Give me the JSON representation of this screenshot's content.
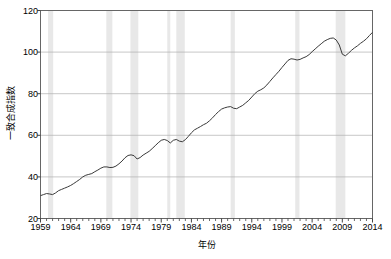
{
  "chart_data": {
    "type": "line",
    "title": "",
    "xlabel": "年份",
    "ylabel": "一致合成指数",
    "xlim": [
      1959,
      2014
    ],
    "ylim": [
      20,
      120
    ],
    "yticks": [
      20,
      40,
      60,
      80,
      100,
      120
    ],
    "ytick_labels": [
      "20",
      "40",
      "60",
      "80",
      "100",
      "120"
    ],
    "xticks": [
      1959,
      1964,
      1969,
      1974,
      1979,
      1984,
      1989,
      1994,
      1999,
      2004,
      2009,
      2014
    ],
    "xtick_labels": [
      "1959",
      "1964",
      "1969",
      "1974",
      "1979",
      "1984",
      "1989",
      "1994",
      "1999",
      "2004",
      "2009",
      "2014"
    ],
    "minor_xtick_interval": 1,
    "grid": "horizontal",
    "grid_color": "#b0b0b0",
    "legend": "none",
    "line_color": "#3a3a3a",
    "line_width": 1.0,
    "shaded_band_color": "#e8e8e8",
    "shaded_band_label": "recession",
    "recession_bands": [
      {
        "start": 1960.25,
        "end": 1961.1
      },
      {
        "start": 1969.9,
        "end": 1970.9
      },
      {
        "start": 1973.9,
        "end": 1975.2
      },
      {
        "start": 1980.0,
        "end": 1980.5
      },
      {
        "start": 1981.5,
        "end": 1982.9
      },
      {
        "start": 1990.5,
        "end": 1991.2
      },
      {
        "start": 2001.2,
        "end": 2001.9
      },
      {
        "start": 2007.9,
        "end": 2009.5
      }
    ],
    "series": [
      {
        "name": "一致合成指数",
        "x": [
          1959.0,
          1959.5,
          1960.0,
          1960.5,
          1961.0,
          1961.5,
          1962.0,
          1962.5,
          1963.0,
          1963.5,
          1964.0,
          1964.5,
          1965.0,
          1965.5,
          1966.0,
          1966.5,
          1967.0,
          1967.5,
          1968.0,
          1968.5,
          1969.0,
          1969.5,
          1970.0,
          1970.5,
          1971.0,
          1971.5,
          1972.0,
          1972.5,
          1973.0,
          1973.5,
          1974.0,
          1974.5,
          1975.0,
          1975.5,
          1976.0,
          1976.5,
          1977.0,
          1977.5,
          1978.0,
          1978.5,
          1979.0,
          1979.5,
          1980.0,
          1980.5,
          1981.0,
          1981.5,
          1982.0,
          1982.5,
          1983.0,
          1983.5,
          1984.0,
          1984.5,
          1985.0,
          1985.5,
          1986.0,
          1986.5,
          1987.0,
          1987.5,
          1988.0,
          1988.5,
          1989.0,
          1989.5,
          1990.0,
          1990.5,
          1991.0,
          1991.5,
          1992.0,
          1992.5,
          1993.0,
          1993.5,
          1994.0,
          1994.5,
          1995.0,
          1995.5,
          1996.0,
          1996.5,
          1997.0,
          1997.5,
          1998.0,
          1998.5,
          1999.0,
          1999.5,
          2000.0,
          2000.5,
          2001.0,
          2001.5,
          2002.0,
          2002.5,
          2003.0,
          2003.5,
          2004.0,
          2004.5,
          2005.0,
          2005.5,
          2006.0,
          2006.5,
          2007.0,
          2007.5,
          2008.0,
          2008.5,
          2009.0,
          2009.5,
          2010.0,
          2010.5,
          2011.0,
          2011.5,
          2012.0,
          2012.5,
          2013.0,
          2013.5,
          2014.0
        ],
        "y": [
          31.0,
          31.5,
          32.0,
          31.8,
          31.5,
          32.3,
          33.4,
          34.0,
          34.6,
          35.2,
          35.9,
          36.8,
          37.8,
          38.8,
          40.0,
          40.8,
          41.2,
          41.6,
          42.5,
          43.3,
          44.2,
          44.8,
          44.8,
          44.5,
          44.6,
          45.2,
          46.3,
          47.6,
          49.2,
          50.3,
          50.6,
          50.2,
          48.6,
          49.3,
          50.5,
          51.4,
          52.3,
          53.6,
          55.0,
          56.4,
          57.6,
          58.0,
          57.5,
          56.3,
          57.6,
          58.0,
          57.2,
          56.9,
          57.9,
          59.5,
          61.2,
          62.6,
          63.4,
          64.2,
          65.1,
          65.8,
          67.0,
          68.4,
          70.0,
          71.4,
          72.6,
          73.2,
          73.6,
          73.8,
          73.0,
          72.8,
          73.6,
          74.4,
          75.6,
          76.8,
          78.4,
          80.0,
          81.2,
          81.9,
          82.8,
          84.2,
          85.9,
          87.6,
          89.2,
          90.8,
          92.6,
          94.3,
          96.0,
          96.8,
          96.6,
          96.2,
          96.5,
          97.2,
          97.8,
          98.8,
          100.2,
          101.5,
          102.8,
          104.0,
          105.2,
          106.0,
          106.6,
          106.8,
          105.8,
          103.4,
          99.0,
          98.2,
          99.4,
          100.8,
          102.0,
          103.0,
          104.2,
          105.2,
          106.4,
          108.0,
          109.5
        ]
      }
    ]
  },
  "axis": {
    "ylabel_text": "一致合成指数",
    "xlabel_text": "年份"
  }
}
